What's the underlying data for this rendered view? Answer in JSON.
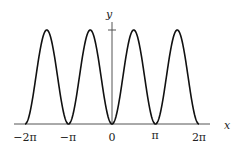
{
  "chart_data": {
    "type": "line",
    "title": "",
    "function": "y = sin^2(x)",
    "xlabel": "x",
    "ylabel": "y",
    "xlim": [
      -6.2832,
      6.2832
    ],
    "ylim": [
      0,
      1
    ],
    "x_ticks": [
      {
        "value": -6.2832,
        "label": "−2π"
      },
      {
        "value": -3.1416,
        "label": "−π"
      },
      {
        "value": 0,
        "label": "0"
      },
      {
        "value": 3.1416,
        "label": "π"
      },
      {
        "value": 6.2832,
        "label": "2π"
      }
    ],
    "y_ticks": [
      {
        "value": 1,
        "label": ""
      }
    ],
    "series": [
      {
        "name": "curve",
        "x": [
          -6.2832,
          -5.4978,
          -4.7124,
          -3.927,
          -3.1416,
          -2.3562,
          -1.5708,
          -0.7854,
          0,
          0.7854,
          1.5708,
          2.3562,
          3.1416,
          3.927,
          4.7124,
          5.4978,
          6.2832
        ],
        "y": [
          0,
          0.5,
          1,
          0.5,
          0,
          0.5,
          1,
          0.5,
          0,
          0.5,
          1,
          0.5,
          0,
          0.5,
          1,
          0.5,
          0
        ]
      }
    ],
    "grid": false,
    "legend": null
  },
  "axes": {
    "x_label": "x",
    "y_label": "y",
    "tick_labels": [
      "−2π",
      "−π",
      "0",
      "π",
      "2π"
    ]
  }
}
